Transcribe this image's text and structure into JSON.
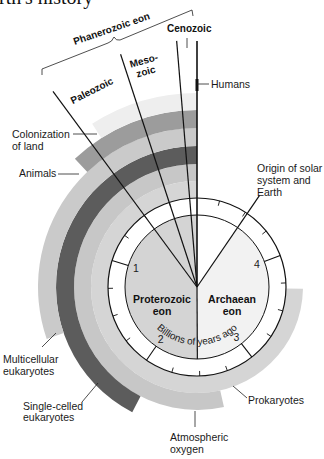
{
  "title": "Earth's history",
  "phanerozoic": {
    "brace_label": "Phanerozoic eon",
    "cenozoic": "Cenozoic",
    "mesozoic": [
      "Meso-",
      "zoic"
    ],
    "paleozoic": "Paleozoic"
  },
  "eons": {
    "proterozoic": [
      "Proterozoic",
      "eon"
    ],
    "archaean": [
      "Archaean",
      "eon"
    ]
  },
  "axis": {
    "label": "Billions of years ago",
    "numbers": [
      {
        "text": "1",
        "bya": 1
      },
      {
        "text": "2",
        "bya": 2
      },
      {
        "text": "3",
        "bya": 3
      },
      {
        "text": "4",
        "bya": 4
      }
    ]
  },
  "events": {
    "humans": "Humans",
    "colonization": [
      "Colonization",
      "of land"
    ],
    "animals": "Animals",
    "origin": [
      "Origin of solar",
      "system and",
      "Earth"
    ],
    "multicellular": [
      "Multicellular",
      "eukaryotes"
    ],
    "single_celled": [
      "Single-celled",
      "eukaryotes"
    ],
    "prokaryotes": "Prokaryotes",
    "oxygen": [
      "Atmospheric",
      "oxygen"
    ]
  },
  "diagram": {
    "center": [
      197,
      287
    ],
    "deg_per_bya": 72.7,
    "ring": {
      "r_inner": 72,
      "r_outer": 89,
      "fill": "#ffffff",
      "stroke": "#111111"
    },
    "tick_step_bya": 0.25,
    "tick_count": 19,
    "number_radius": 64,
    "sectors": [
      {
        "id": "phanerozoic-proterozoic",
        "from_bya": 0,
        "to_bya": 2.48,
        "fill": "#d4d4d4"
      },
      {
        "id": "archaean",
        "from_bya": 2.48,
        "to_bya": 4.48,
        "fill": "#f2f2f2"
      }
    ],
    "bands": [
      {
        "id": "prokaryotes",
        "start_bya": 3.7,
        "r_inner": 89,
        "r_outer": 106,
        "color": "#d5d5d5"
      },
      {
        "id": "atmospheric-oxygen",
        "start_bya": 2.65,
        "r_inner": 106,
        "r_outer": 123,
        "color": "#c7c7c7"
      },
      {
        "id": "single-celled-eukaryotes",
        "start_bya": 2.1,
        "r_inner": 123,
        "r_outer": 141,
        "color": "#5c5c5c"
      },
      {
        "id": "multicellular-eukaryotes",
        "start_bya": 1.5,
        "r_inner": 141,
        "r_outer": 159,
        "color": "#cacaca"
      },
      {
        "id": "animals",
        "start_bya": 0.6,
        "r_inner": 159,
        "r_outer": 177,
        "color": "#9c9c9c"
      },
      {
        "id": "colonization-of-land",
        "start_bya": 0.45,
        "r_inner": 177,
        "r_outer": 194,
        "color": "#eeeeee"
      }
    ],
    "lines": [
      {
        "id": "present",
        "bya": 0,
        "r_end": 246,
        "width": 1.6
      },
      {
        "id": "cenozoic-start",
        "bya": 0.065,
        "r_end": 247,
        "width": 1.2
      },
      {
        "id": "mesozoic-start",
        "bya": 0.25,
        "r_end": 245,
        "width": 1.2
      },
      {
        "id": "paleozoic-start",
        "bya": 0.5,
        "r_end": 243,
        "width": 1.2
      },
      {
        "id": "proterozoic-archaean-boundary",
        "bya": 2.48,
        "r_end": 72,
        "width": 1.2
      },
      {
        "id": "origin-of-earth",
        "bya": 4.48,
        "r_end": 111,
        "width": 1.2
      }
    ]
  }
}
